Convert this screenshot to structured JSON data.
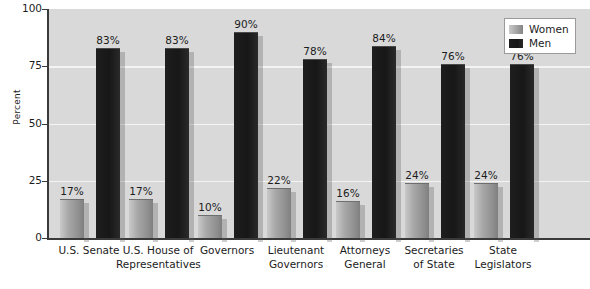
{
  "chart_data": {
    "type": "bar",
    "title": "",
    "xlabel": "",
    "ylabel": "Percent",
    "ylim": [
      0,
      100
    ],
    "yticks": [
      0,
      25,
      50,
      75,
      100
    ],
    "ytick_labels": [
      "0",
      "25",
      "50",
      "75",
      "100"
    ],
    "grid": true,
    "legend_position": "top-right",
    "value_suffix": "%",
    "categories": [
      "U.S. Senate",
      "U.S. House of Representatives",
      "Governors",
      "Lieutenant Governors",
      "Attorneys General",
      "Secretaries of State",
      "State Legislators"
    ],
    "category_lines": [
      [
        "U.S. Senate"
      ],
      [
        "U.S. House of",
        "Representatives"
      ],
      [
        "Governors"
      ],
      [
        "Lieutenant",
        "Governors"
      ],
      [
        "Attorneys",
        "General"
      ],
      [
        "Secretaries",
        "of State"
      ],
      [
        "State",
        "Legislators"
      ]
    ],
    "series": [
      {
        "name": "Women",
        "color": "#a0a0a0",
        "values": [
          17,
          17,
          10,
          22,
          16,
          24,
          24
        ],
        "labels": [
          "17%",
          "17%",
          "10%",
          "22%",
          "16%",
          "24%",
          "24%"
        ]
      },
      {
        "name": "Men",
        "color": "#1a1a1a",
        "values": [
          83,
          83,
          90,
          78,
          84,
          76,
          76
        ],
        "labels": [
          "83%",
          "83%",
          "90%",
          "78%",
          "84%",
          "76%",
          "76%"
        ]
      }
    ]
  },
  "legend": {
    "entries": [
      {
        "label": "Women",
        "swatch": "women-swatch"
      },
      {
        "label": "Men",
        "swatch": "men-swatch"
      }
    ]
  },
  "colors": {
    "plot_background": "#d9d9d9",
    "page_background": "#ffffff",
    "gridline": "#f4f4f4",
    "axis": "#3a3a3a",
    "text": "#1c1c1c",
    "women_bar": "#a0a0a0",
    "men_bar": "#1a1a1a"
  }
}
